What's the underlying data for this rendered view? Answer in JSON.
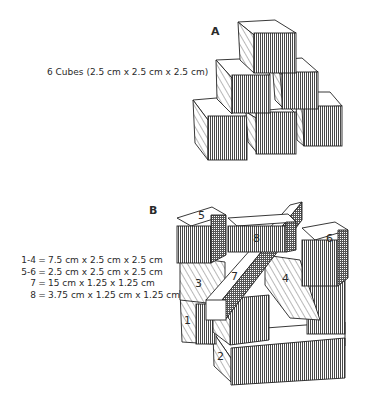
{
  "figure_a": {
    "label": "A",
    "caption": "6 Cubes (2.5 cm x 2.5 cm x 2.5 cm)"
  },
  "figure_b": {
    "label": "B",
    "legend": [
      {
        "key": "1-4",
        "eq": "=",
        "value": "7.5 cm x 2.5 cm x 2.5 cm"
      },
      {
        "key": "5-6",
        "eq": "=",
        "value": "2.5 cm x 2.5 cm x 2.5 cm"
      },
      {
        "key": "7",
        "eq": "=",
        "value": "15 cm x 1.25 x 1.25 cm"
      },
      {
        "key": "8",
        "eq": "=",
        "value": "3.75 cm x 1.25 cm x 1.25 cm"
      }
    ],
    "block_numbers": [
      "1",
      "2",
      "3",
      "4",
      "5",
      "6",
      "7",
      "8"
    ]
  }
}
